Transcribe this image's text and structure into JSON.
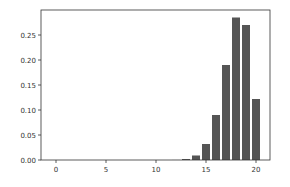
{
  "chart_data": {
    "type": "bar",
    "title": "",
    "xlabel": "",
    "ylabel": "",
    "categories": [
      0,
      1,
      2,
      3,
      4,
      5,
      6,
      7,
      8,
      9,
      10,
      11,
      12,
      13,
      14,
      15,
      16,
      17,
      18,
      19,
      20
    ],
    "values": [
      0,
      0,
      0,
      0,
      0,
      0,
      0,
      0,
      0,
      0,
      0,
      0,
      0.0001,
      0.002,
      0.009,
      0.032,
      0.09,
      0.19,
      0.285,
      0.27,
      0.122
    ],
    "xlim": [
      -1.5,
      21.4
    ],
    "ylim": [
      0,
      0.3
    ],
    "xticks": [
      0,
      5,
      10,
      15,
      20
    ],
    "xtick_labels": [
      "0",
      "5",
      "10",
      "15",
      "20"
    ],
    "yticks": [
      0.0,
      0.05,
      0.1,
      0.15,
      0.2,
      0.25
    ],
    "ytick_labels": [
      "0.00",
      "0.05",
      "0.10",
      "0.15",
      "0.20",
      "0.25"
    ],
    "bar_width": 0.8,
    "bar_color": "#555555",
    "grid": false,
    "legend": null
  }
}
